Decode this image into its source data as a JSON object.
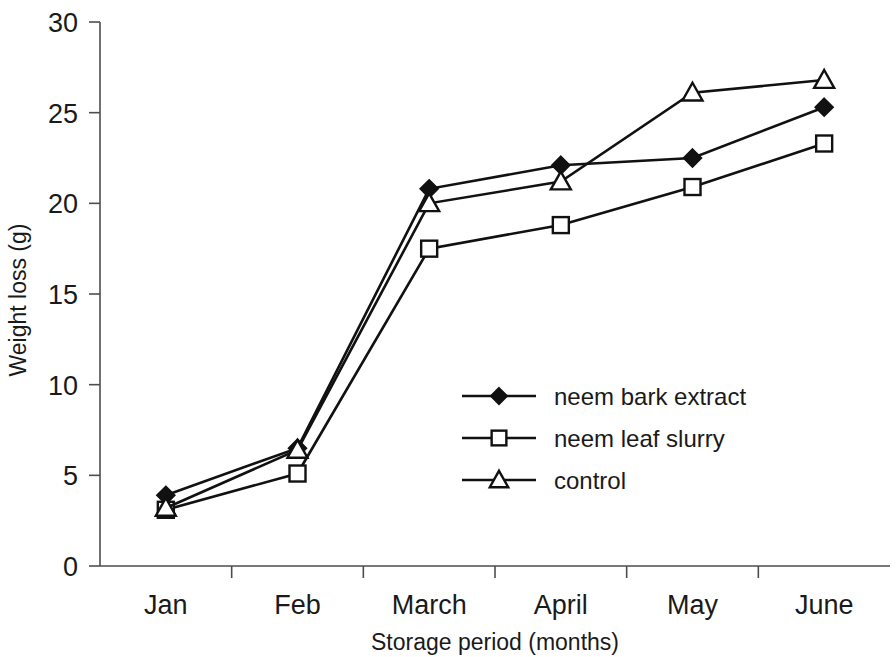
{
  "chart_data": {
    "type": "line",
    "title": "",
    "xlabel": "Storage period (months)",
    "ylabel": "Weight loss (g)",
    "categories": [
      "Jan",
      "Feb",
      "March",
      "April",
      "May",
      "June"
    ],
    "ylim": [
      0,
      30
    ],
    "yticks": [
      0,
      5,
      10,
      15,
      20,
      25,
      30
    ],
    "ytick_labels": [
      "0",
      "5",
      "10",
      "15",
      "20",
      "25",
      "30"
    ],
    "grid": false,
    "legend_position": "center",
    "series": [
      {
        "name": "neem bark extract",
        "marker": "filled-diamond",
        "values": [
          3.9,
          6.5,
          20.8,
          22.1,
          22.5,
          25.3
        ]
      },
      {
        "name": "neem leaf slurry",
        "marker": "open-square",
        "values": [
          3.1,
          5.1,
          17.5,
          18.8,
          20.9,
          23.3
        ]
      },
      {
        "name": "control",
        "marker": "open-triangle",
        "values": [
          3.2,
          6.4,
          20.0,
          21.2,
          26.1,
          26.8
        ]
      }
    ]
  },
  "colors": {
    "line": "#111111",
    "axis": "#4d4d4d",
    "background": "#ffffff"
  }
}
